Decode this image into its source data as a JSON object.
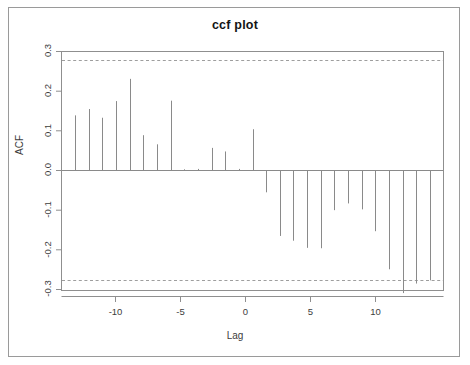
{
  "figure": {
    "title": "ccf plot",
    "frame_color": "#9a9a9a",
    "axis_color": "#808080",
    "segment_color": "#8a8a8a",
    "ci_color": "#9e9e9e"
  },
  "chart_data": {
    "type": "bar",
    "title": "ccf plot",
    "xlabel": "Lag",
    "ylabel": "ACF",
    "xlim": [
      -14,
      14
    ],
    "ylim": [
      -0.32,
      0.3
    ],
    "xticks": [
      -10,
      -5,
      0,
      5,
      10
    ],
    "xtick_labels": [
      "-10",
      "-5",
      "0",
      "5",
      "10"
    ],
    "yticks": [
      0.3,
      0.2,
      0.1,
      0.0,
      -0.1,
      -0.2,
      -0.3
    ],
    "ytick_labels": [
      "0.3",
      "0.2",
      "0.1",
      "0.0",
      "-0.1",
      "-0.2",
      "-0.3"
    ],
    "grid": false,
    "legend": null,
    "confidence_lines": [
      0.277,
      -0.277
    ],
    "confidence_style": "dashed",
    "zero_line": 0.0,
    "categories": [
      -13,
      -12,
      -11,
      -10,
      -9,
      -8,
      -7,
      -6,
      -5,
      -4,
      -3,
      -2,
      -1,
      0,
      1,
      2,
      3,
      4,
      5,
      6,
      7,
      8,
      9,
      10,
      11,
      12,
      13
    ],
    "values": [
      0.139,
      0.155,
      0.133,
      0.175,
      0.231,
      0.089,
      0.066,
      0.176,
      0.003,
      0.004,
      0.057,
      0.048,
      0.004,
      0.104,
      -0.055,
      -0.165,
      -0.177,
      -0.195,
      -0.196,
      -0.1,
      -0.083,
      -0.098,
      -0.153,
      -0.249,
      -0.309,
      -0.285,
      -0.277
    ]
  }
}
